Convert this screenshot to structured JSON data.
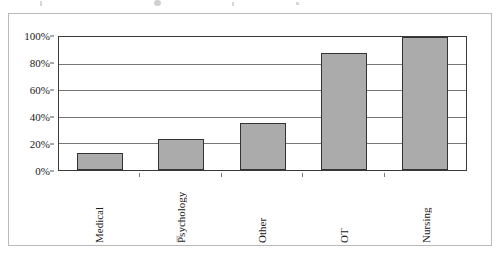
{
  "chart_data": {
    "type": "bar",
    "title": "",
    "xlabel": "",
    "ylabel": "",
    "categories": [
      "Medical",
      "Psychology",
      "Other",
      "OT",
      "Nursing"
    ],
    "values": [
      13,
      23,
      35,
      88,
      100
    ],
    "ylim": [
      0,
      100
    ],
    "y_ticks": [
      0,
      20,
      40,
      60,
      80,
      100
    ],
    "y_tick_labels": [
      "0%",
      "20%",
      "40%",
      "60%",
      "80%",
      "100%"
    ],
    "value_suffix": "%",
    "grid": true,
    "grid_axis": "y",
    "legend": false,
    "legend_position": "none",
    "series": [
      {
        "name": "",
        "values": [
          13,
          23,
          35,
          88,
          100
        ]
      }
    ],
    "colors": {
      "bar_fill": "#ababab",
      "bar_border": "#333333",
      "gridline": "#777777",
      "axis": "#3a3a3a",
      "text": "#1a1a1a",
      "frame": "#b9b9b9",
      "background": "#ffffff"
    }
  },
  "artifacts": {
    "bottom_mark": "p"
  }
}
